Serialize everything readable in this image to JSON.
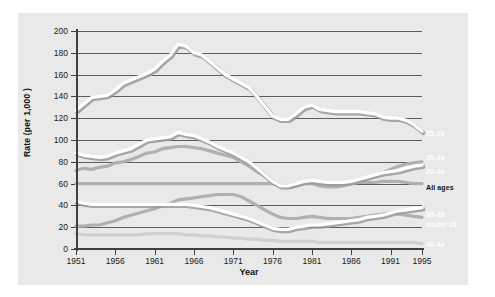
{
  "chart_data": {
    "type": "line",
    "title": "",
    "xlabel": "Year",
    "ylabel": "Rate (per 1,000 )",
    "xlim": [
      1951,
      1995
    ],
    "ylim": [
      0,
      200
    ],
    "grid": true,
    "legend_position": "right",
    "yticks": [
      0,
      20,
      40,
      60,
      80,
      100,
      120,
      140,
      160,
      180,
      200
    ],
    "xticks": [
      1951,
      1956,
      1961,
      1966,
      1971,
      1976,
      1981,
      1986,
      1991,
      1995
    ],
    "x": [
      1951,
      1952,
      1953,
      1954,
      1955,
      1956,
      1957,
      1958,
      1959,
      1960,
      1961,
      1962,
      1963,
      1964,
      1965,
      1966,
      1967,
      1968,
      1969,
      1970,
      1971,
      1972,
      1973,
      1974,
      1975,
      1976,
      1977,
      1978,
      1979,
      1980,
      1981,
      1982,
      1983,
      1984,
      1985,
      1986,
      1987,
      1988,
      1989,
      1990,
      1991,
      1992,
      1993,
      1994,
      1995
    ],
    "series": [
      {
        "name": "25-29",
        "color": "#ffffff",
        "values": [
          127,
          133,
          139,
          140,
          141,
          146,
          152,
          155,
          158,
          161,
          165,
          172,
          178,
          188,
          186,
          180,
          178,
          172,
          166,
          160,
          156,
          152,
          148,
          140,
          131,
          122,
          119,
          119,
          124,
          130,
          132,
          128,
          127,
          126,
          126,
          126,
          126,
          125,
          124,
          121,
          120,
          120,
          118,
          114,
          108
        ]
      },
      {
        "name": "30-34",
        "color": "#b0b0b0",
        "values": [
          72,
          74,
          73,
          75,
          76,
          79,
          80,
          82,
          85,
          88,
          89,
          92,
          93,
          94,
          94,
          93,
          92,
          90,
          88,
          86,
          84,
          80,
          76,
          71,
          67,
          62,
          58,
          57,
          58,
          60,
          60,
          58,
          57,
          57,
          58,
          60,
          62,
          65,
          67,
          70,
          73,
          76,
          78,
          79,
          80
        ]
      },
      {
        "name": "20-24",
        "color": "#ffffff",
        "values": [
          88,
          86,
          85,
          84,
          85,
          88,
          90,
          92,
          96,
          100,
          101,
          102,
          103,
          107,
          105,
          104,
          101,
          98,
          94,
          91,
          88,
          84,
          80,
          74,
          68,
          62,
          58,
          58,
          60,
          62,
          63,
          62,
          61,
          61,
          61,
          62,
          64,
          66,
          68,
          70,
          71,
          72,
          74,
          76,
          77
        ]
      },
      {
        "name": "All ages",
        "color": "#b0b0b0",
        "values": [
          60,
          60,
          60,
          60,
          60,
          60,
          60,
          60,
          60,
          60,
          60,
          60,
          60,
          60,
          60,
          60,
          60,
          60,
          60,
          60,
          60,
          60,
          60,
          60,
          60,
          60,
          58,
          58,
          60,
          60,
          61,
          60,
          60,
          60,
          60,
          60,
          61,
          61,
          61,
          62,
          62,
          62,
          61,
          60,
          60
        ]
      },
      {
        "name": "35-39",
        "color": "#ffffff",
        "values": [
          44,
          42,
          41,
          41,
          41,
          41,
          41,
          41,
          41,
          41,
          41,
          41,
          41,
          41,
          41,
          40,
          39,
          38,
          36,
          34,
          32,
          30,
          28,
          25,
          22,
          19,
          18,
          18,
          20,
          21,
          22,
          22,
          23,
          24,
          25,
          26,
          27,
          29,
          30,
          31,
          33,
          35,
          36,
          37,
          38
        ]
      },
      {
        "name": "Under 20",
        "color": "#b0b0b0",
        "values": [
          21,
          21,
          22,
          22,
          24,
          26,
          29,
          31,
          33,
          35,
          37,
          40,
          42,
          45,
          46,
          47,
          48,
          49,
          50,
          50,
          50,
          48,
          44,
          40,
          36,
          32,
          29,
          28,
          28,
          29,
          30,
          29,
          28,
          28,
          28,
          28,
          29,
          30,
          31,
          32,
          33,
          32,
          31,
          30,
          29
        ]
      },
      {
        "name": "40-44",
        "color": "#d0d0d0",
        "values": [
          14,
          13,
          13,
          13,
          13,
          13,
          13,
          13,
          13,
          14,
          14,
          14,
          14,
          14,
          13,
          13,
          12,
          12,
          11,
          11,
          10,
          10,
          9,
          9,
          8,
          8,
          7,
          7,
          7,
          7,
          7,
          6,
          6,
          6,
          6,
          6,
          6,
          6,
          6,
          6,
          6,
          6,
          6,
          6,
          5
        ]
      }
    ]
  },
  "legend": [
    {
      "label": "25-29",
      "color": "#ffffff",
      "top": 130
    },
    {
      "label": "30-34",
      "color": "#ffffff",
      "top": 154
    },
    {
      "label": "20-24",
      "color": "#ffffff",
      "top": 168
    },
    {
      "label": "All ages",
      "color": "#111111",
      "top": 184
    },
    {
      "label": "35-39",
      "color": "#ffffff",
      "top": 211
    },
    {
      "label": "Under 20",
      "color": "#ffffff",
      "top": 221
    },
    {
      "label": "40-44",
      "color": "#ffffff",
      "top": 241
    }
  ]
}
